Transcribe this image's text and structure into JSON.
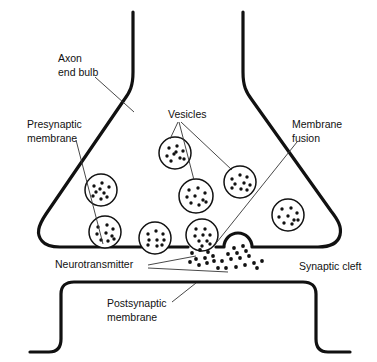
{
  "figure": {
    "background_color": "#ffffff",
    "line_color": "#111111",
    "label_color": "#111111",
    "leader_color": "#333333",
    "width": 377,
    "height": 362
  },
  "labels": {
    "axon_end_bulb_line1": "Axon",
    "axon_end_bulb_line2": "end bulb",
    "presynaptic_membrane_line1": "Presynaptic",
    "presynaptic_membrane_line2": "membrane",
    "vesicles": "Vesicles",
    "membrane_fusion_line1": "Membrane",
    "membrane_fusion_line2": "fusion",
    "neurotransmitter": "Neurotransmitter",
    "synaptic_cleft": "Synaptic cleft",
    "postsynaptic_membrane_line1": "Postsynaptic",
    "postsynaptic_membrane_line2": "membrane"
  },
  "vesicles": [
    {
      "id": "vesicle-upper-left-mid",
      "cx": 175,
      "cy": 153,
      "r": 16,
      "dots": [
        [
          -6,
          -5
        ],
        [
          2,
          -7
        ],
        [
          8,
          -2
        ],
        [
          -8,
          3
        ],
        [
          -1,
          1
        ],
        [
          5,
          5
        ],
        [
          -4,
          8
        ],
        [
          9,
          6
        ],
        [
          1,
          -1
        ]
      ]
    },
    {
      "id": "vesicle-left-mid",
      "cx": 101,
      "cy": 190,
      "r": 16,
      "dots": [
        [
          -7,
          -4
        ],
        [
          1,
          -7
        ],
        [
          8,
          -3
        ],
        [
          -5,
          2
        ],
        [
          3,
          3
        ],
        [
          -8,
          6
        ],
        [
          6,
          7
        ],
        [
          0,
          9
        ],
        [
          -1,
          -1
        ]
      ]
    },
    {
      "id": "vesicle-center-mid",
      "cx": 196,
      "cy": 196,
      "r": 17,
      "dots": [
        [
          -7,
          -6
        ],
        [
          2,
          -8
        ],
        [
          9,
          -3
        ],
        [
          -9,
          1
        ],
        [
          -1,
          0
        ],
        [
          7,
          4
        ],
        [
          -5,
          7
        ],
        [
          3,
          9
        ],
        [
          10,
          6
        ]
      ]
    },
    {
      "id": "vesicle-right-upper",
      "cx": 240,
      "cy": 182,
      "r": 16,
      "dots": [
        [
          -8,
          -3
        ],
        [
          0,
          -7
        ],
        [
          7,
          -5
        ],
        [
          -5,
          2
        ],
        [
          4,
          1
        ],
        [
          10,
          3
        ],
        [
          -8,
          6
        ],
        [
          1,
          7
        ],
        [
          7,
          8
        ]
      ]
    },
    {
      "id": "vesicle-far-right",
      "cx": 288,
      "cy": 215,
      "r": 16,
      "dots": [
        [
          -6,
          -6
        ],
        [
          3,
          -7
        ],
        [
          9,
          -2
        ],
        [
          -9,
          2
        ],
        [
          0,
          1
        ],
        [
          6,
          5
        ],
        [
          -4,
          8
        ],
        [
          4,
          9
        ],
        [
          10,
          5
        ]
      ]
    },
    {
      "id": "vesicle-lower-left",
      "cx": 105,
      "cy": 232,
      "r": 16,
      "dots": [
        [
          -7,
          -5
        ],
        [
          2,
          -7
        ],
        [
          8,
          -3
        ],
        [
          -8,
          2
        ],
        [
          1,
          1
        ],
        [
          7,
          4
        ],
        [
          -4,
          8
        ],
        [
          3,
          9
        ],
        [
          9,
          7
        ]
      ]
    },
    {
      "id": "vesicle-lower-mid",
      "cx": 155,
      "cy": 238,
      "r": 16,
      "dots": [
        [
          -7,
          -4
        ],
        [
          1,
          -7
        ],
        [
          8,
          -4
        ],
        [
          -6,
          2
        ],
        [
          2,
          2
        ],
        [
          9,
          2
        ],
        [
          -7,
          7
        ],
        [
          2,
          8
        ],
        [
          7,
          7
        ]
      ]
    },
    {
      "id": "vesicle-fusing",
      "cx": 202,
      "cy": 235,
      "r": 16,
      "dots": [
        [
          -6,
          -6
        ],
        [
          3,
          -6
        ],
        [
          -7,
          1
        ],
        [
          1,
          0
        ],
        [
          8,
          0
        ],
        [
          -3,
          6
        ],
        [
          5,
          6
        ],
        [
          0,
          11
        ],
        [
          8,
          9
        ]
      ]
    }
  ],
  "neurotransmitter_clouds": [
    {
      "id": "nt-cloud-fusing-vesicle",
      "dots": [
        [
          192,
          253
        ],
        [
          200,
          250
        ],
        [
          208,
          252
        ],
        [
          196,
          259
        ],
        [
          205,
          258
        ],
        [
          213,
          256
        ],
        [
          190,
          262
        ],
        [
          199,
          265
        ],
        [
          207,
          263
        ],
        [
          214,
          261
        ]
      ]
    },
    {
      "id": "nt-cloud-fusion-pore",
      "dots": [
        [
          234,
          248
        ],
        [
          243,
          246
        ],
        [
          228,
          254
        ],
        [
          237,
          253
        ],
        [
          246,
          251
        ],
        [
          222,
          261
        ],
        [
          231,
          259
        ],
        [
          240,
          258
        ],
        [
          249,
          256
        ],
        [
          226,
          268
        ],
        [
          236,
          267
        ],
        [
          245,
          265
        ],
        [
          254,
          263
        ],
        [
          262,
          261
        ],
        [
          218,
          268
        ],
        [
          257,
          268
        ]
      ]
    }
  ],
  "fusion_pore": {
    "id": "fusion-pore-dome",
    "center_x": 238,
    "base_y": 246,
    "radius": 14
  }
}
